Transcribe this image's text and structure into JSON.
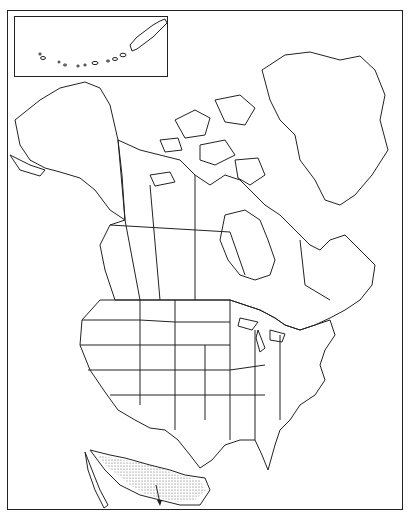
{
  "map": {
    "title": "",
    "region": "North America",
    "style": "black-and-white outline map",
    "inset": "Aleutian Islands (Alaska)",
    "highlighted_area": "Northern Mexico (stippled range)",
    "colors": {
      "line": "#222222",
      "background": "#ffffff",
      "stipple": "#555555"
    }
  }
}
